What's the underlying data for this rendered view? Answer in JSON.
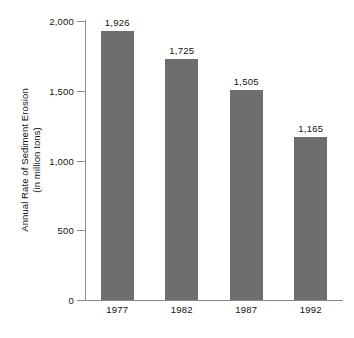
{
  "chart_data": {
    "type": "bar",
    "title": "",
    "subtitle": "",
    "xlabel": "",
    "ylabel": "Annual Rate of Sediment Erosion",
    "ylabel_line2": "(in million tons)",
    "categories": [
      "1977",
      "1982",
      "1987",
      "1992"
    ],
    "values": [
      1926,
      1725,
      1505,
      1165
    ],
    "value_labels": [
      "1,926",
      "1,725",
      "1,505",
      "1,165"
    ],
    "ylim": [
      0,
      2000
    ],
    "ytick_values": [
      2000,
      1500,
      1000,
      500,
      0
    ],
    "ytick_labels": [
      "2,000",
      "1,500",
      "1,000",
      "500",
      "0"
    ],
    "grid": false,
    "legend": false,
    "legend_position": "none",
    "series": [
      {
        "name": "Annual Rate of Sediment Erosion",
        "values": [
          1926,
          1725,
          1505,
          1165
        ]
      }
    ]
  },
  "colors": {
    "bar_fill": "#6e6e6e",
    "axis_line": "#8a8a8a",
    "text": "#111111",
    "background": "#ffffff"
  }
}
